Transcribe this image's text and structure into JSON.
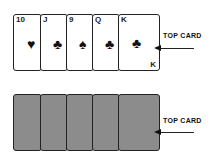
{
  "top_row": {
    "cards": [
      {
        "rank": "10",
        "suit": "♥",
        "suit_name": "hearts"
      },
      {
        "rank": "J",
        "suit": "♣",
        "suit_name": "clubs"
      },
      {
        "rank": "9",
        "suit": "♠",
        "suit_name": "spades"
      },
      {
        "rank": "Q",
        "suit": "♣",
        "suit_name": "clubs"
      },
      {
        "rank": "K",
        "suit": "♣",
        "suit_name": "clubs",
        "bottom_rank": "K"
      }
    ],
    "label": "TOP CARD"
  },
  "bottom_row": {
    "cards": 5,
    "label": "TOP CARD",
    "back_color": "#8c8c8c"
  }
}
